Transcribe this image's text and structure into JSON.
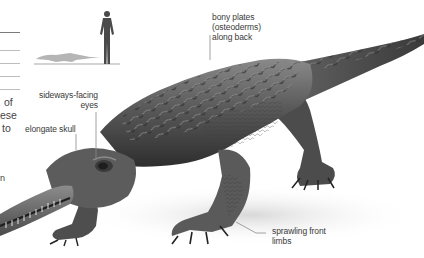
{
  "figure": {
    "labels": [
      {
        "id": "bony-plates",
        "lines": [
          "bony plates",
          "(osteoderms)",
          "along back"
        ]
      },
      {
        "id": "sideways-eyes",
        "lines": [
          "sideways-facing",
          "eyes"
        ]
      },
      {
        "id": "elongate-skull",
        "lines": [
          "elongate skull"
        ]
      },
      {
        "id": "sprawling-limbs",
        "lines": [
          "sprawling front",
          "limbs"
        ]
      }
    ],
    "cropped_text_left": [
      "of",
      "ese",
      "to",
      "n"
    ],
    "scale_comparison": {
      "human": "human silhouette",
      "animal": "crocodilian silhouette"
    }
  },
  "colors": {
    "background": "#ffffff",
    "label_text": "#3a3a3a",
    "leader_line": "#8a8a8a",
    "body_dark": "#3c3c3c",
    "body_mid": "#6e6e6e",
    "body_light": "#a8a8a8"
  }
}
